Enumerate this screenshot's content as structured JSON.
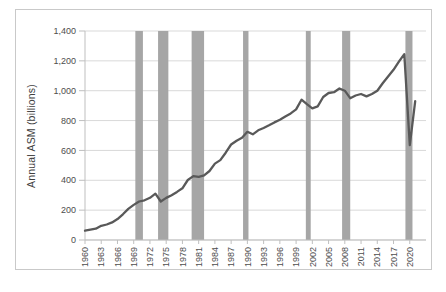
{
  "chart_data": {
    "type": "line",
    "title": "",
    "ylabel": "Annual ASM (billions)",
    "xlabel": "",
    "ylim": [
      0,
      1400
    ],
    "xlim": [
      1960,
      2023
    ],
    "grid": "horizontal",
    "legend": "none",
    "yticks": [
      0,
      200,
      400,
      600,
      800,
      1000,
      1200,
      1400
    ],
    "ytick_labels": [
      "0",
      "200",
      "400",
      "600",
      "800",
      "1,000",
      "1,200",
      "1,400"
    ],
    "xticks": [
      1960,
      1963,
      1966,
      1969,
      1972,
      1975,
      1978,
      1981,
      1984,
      1987,
      1990,
      1993,
      1996,
      1999,
      2002,
      2005,
      2008,
      2011,
      2014,
      2017,
      2020
    ],
    "series": [
      {
        "name": "Annual ASM",
        "x": [
          1960,
          1961,
          1962,
          1963,
          1964,
          1965,
          1966,
          1967,
          1968,
          1969,
          1970,
          1971,
          1972,
          1973,
          1974,
          1975,
          1976,
          1977,
          1978,
          1979,
          1980,
          1981,
          1982,
          1983,
          1984,
          1985,
          1986,
          1987,
          1988,
          1989,
          1990,
          1991,
          1992,
          1993,
          1994,
          1995,
          1996,
          1997,
          1998,
          1999,
          2000,
          2001,
          2002,
          2003,
          2004,
          2005,
          2006,
          2007,
          2008,
          2009,
          2010,
          2011,
          2012,
          2013,
          2014,
          2015,
          2016,
          2017,
          2018,
          2019,
          2020,
          2021
        ],
        "values": [
          62,
          70,
          76,
          95,
          104,
          118,
          140,
          172,
          208,
          235,
          258,
          266,
          283,
          310,
          258,
          282,
          300,
          322,
          346,
          402,
          428,
          423,
          433,
          462,
          512,
          535,
          585,
          640,
          665,
          685,
          725,
          708,
          735,
          750,
          768,
          788,
          806,
          828,
          848,
          875,
          940,
          910,
          882,
          895,
          958,
          985,
          990,
          1015,
          1000,
          950,
          968,
          978,
          962,
          978,
          1000,
          1050,
          1095,
          1140,
          1195,
          1245,
          635,
          930
        ]
      }
    ],
    "recession_bands": [
      [
        1969.3,
        1970.7
      ],
      [
        1973.5,
        1975.4
      ],
      [
        1979.7,
        1982.0
      ],
      [
        1989.2,
        1990.2
      ],
      [
        2000.8,
        2001.7
      ],
      [
        2007.5,
        2009.0
      ],
      [
        2019.2,
        2020.5
      ]
    ],
    "colors": {
      "line": "#595959",
      "band": "#a6a6a6",
      "gridline": "#d9d9d9",
      "axis": "#bfbfbf",
      "tick_text": "#4d4d4d",
      "border": "#c9c9c9",
      "background": "#ffffff"
    }
  }
}
